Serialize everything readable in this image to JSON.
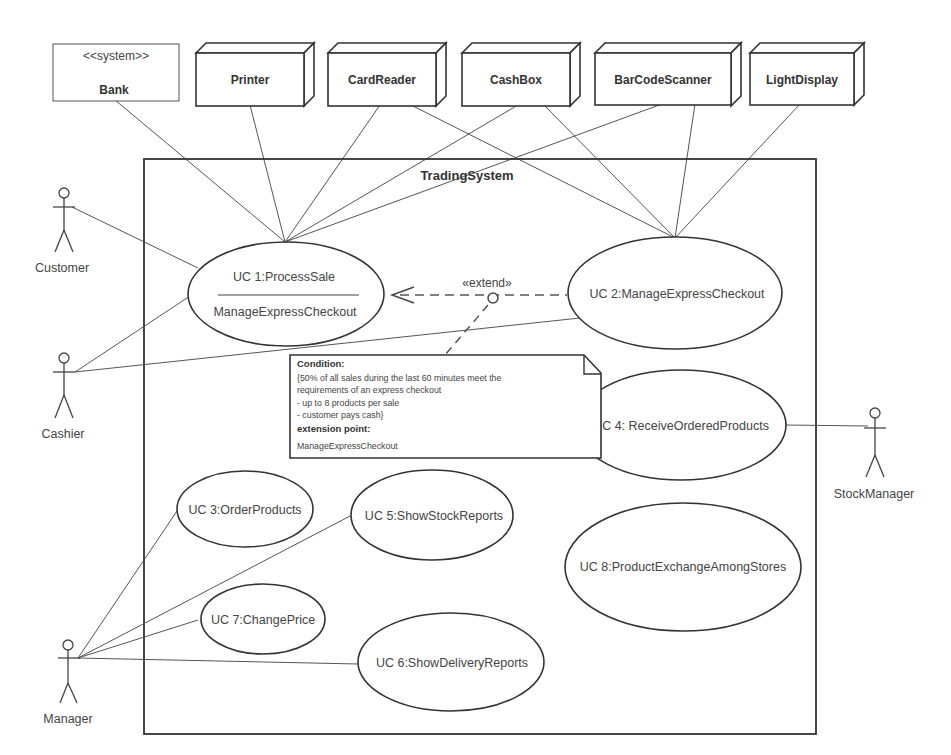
{
  "title": "TradingSystem",
  "external_systems": [
    {
      "stereotype": "<<system>>",
      "name": "Bank"
    },
    {
      "name": "Printer"
    },
    {
      "name": "CardReader"
    },
    {
      "name": "CashBox"
    },
    {
      "name": "BarCodeScanner"
    },
    {
      "name": "LightDisplay"
    }
  ],
  "actors": {
    "customer": "Customer",
    "cashier": "Cashier",
    "manager": "Manager",
    "stock_manager": "StockManager"
  },
  "use_cases": {
    "uc1": {
      "name": "UC 1:ProcessSale",
      "extension_point": "ManageExpressCheckout"
    },
    "uc2": "UC 2:ManageExpressCheckout",
    "uc3": "UC 3:OrderProducts",
    "uc4": "UC 4: ReceiveOrderedProducts",
    "uc5": "UC 5:ShowStockReports",
    "uc6": "UC 6:ShowDeliveryReports",
    "uc7": "UC 7:ChangePrice",
    "uc8": "UC 8:ProductExchangeAmongStores"
  },
  "extend_label": "«extend»",
  "note": {
    "condition_heading": "Condition:",
    "line1": "{50% of all sales during the last 60 minutes meet the",
    "line2": "requirements of an express checkout",
    "line3": "- up to 8 products per sale",
    "line4": "- customer pays cash}",
    "ext_heading": "extension point:",
    "ext_value": "ManageExpressCheckout"
  }
}
